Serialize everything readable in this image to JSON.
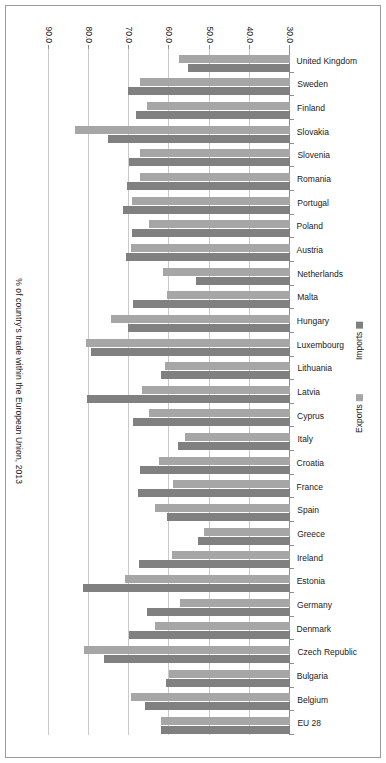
{
  "chart_data": {
    "type": "bar",
    "orientation": "horizontal",
    "title": "% of country's trade within the European Union, 2013",
    "xlabel": "",
    "ylabel": "% of country's trade within the European Union, 2013",
    "xlim": [
      30.0,
      90.0
    ],
    "xticks": [
      "30.0",
      "40.0",
      "50.0",
      "60.0",
      "70.0",
      "80.0",
      "90.0"
    ],
    "grid": true,
    "legend_position": "bottom-right",
    "rotated_180": true,
    "categories": [
      "EU 28",
      "Belgium",
      "Bulgaria",
      "Czech Republic",
      "Denmark",
      "Germany",
      "Estonia",
      "Ireland",
      "Greece",
      "Spain",
      "France",
      "Croatia",
      "Italy",
      "Cyprus",
      "Latvia",
      "Lithuania",
      "Luxembourg",
      "Hungary",
      "Malta",
      "Netherlands",
      "Austria",
      "Poland",
      "Portugal",
      "Romania",
      "Slovenia",
      "Slovakia",
      "Finland",
      "Sweden",
      "United Kingdom"
    ],
    "series": [
      {
        "name": "Imports",
        "color": "#808080",
        "values": [
          62.1,
          66.0,
          60.8,
          76.2,
          70.0,
          65.5,
          81.5,
          67.5,
          52.9,
          60.5,
          67.9,
          67.3,
          57.8,
          69.0,
          80.5,
          62.0,
          79.6,
          70.3,
          69.2,
          53.3,
          70.8,
          69.3,
          71.5,
          70.6,
          70.0,
          75.2,
          68.4,
          70.4,
          55.3
        ]
      },
      {
        "name": "Exports",
        "color": "#a6a6a6",
        "values": [
          62.1,
          69.5,
          60.0,
          81.2,
          63.5,
          57.5,
          71.1,
          59.5,
          51.5,
          63.5,
          59.2,
          62.5,
          56.1,
          65.2,
          66.9,
          61.0,
          80.9,
          74.6,
          60.5,
          61.5,
          69.7,
          65.2,
          69.4,
          67.4,
          67.4,
          83.5,
          65.7,
          67.4,
          57.6
        ]
      }
    ]
  },
  "legend": {
    "items": [
      {
        "label": "Exports",
        "color": "#a6a6a6"
      },
      {
        "label": "Imports",
        "color": "#808080"
      }
    ]
  },
  "axis": {
    "title": "% of country's trade within the European Union, 2013"
  }
}
